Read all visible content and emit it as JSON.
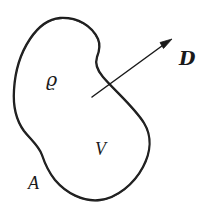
{
  "figure": {
    "kind": "line-drawing",
    "background_color": "#ffffff",
    "ink_color": "#1a1a1a"
  },
  "labels": {
    "charge_density": {
      "text": "ϱ",
      "name": "rho",
      "position": "inside upper-left"
    },
    "volume": {
      "text": "V",
      "name": "V",
      "position": "inside lower-middle"
    },
    "surface": {
      "text": "A",
      "name": "A",
      "position": "outside bottom-left"
    },
    "displacement_vector": {
      "text": "D",
      "name": "D",
      "position": "outside upper-right"
    }
  },
  "arrow": {
    "name": "displacement-arrow",
    "tail": [
      92,
      97
    ],
    "tip": [
      172,
      40
    ],
    "has_arrowhead": true,
    "crosses_boundary": true
  },
  "colors": {
    "ink": "#1a1a1a",
    "background": "#ffffff"
  }
}
